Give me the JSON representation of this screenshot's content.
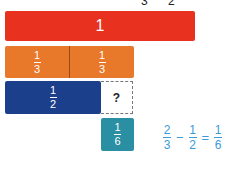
{
  "top_clipped": {
    "left": "3",
    "right": "2"
  },
  "bars": {
    "whole": {
      "label": "1",
      "color": "#e8311f"
    },
    "thirds": {
      "color": "#e8782a",
      "segments": [
        {
          "num": "1",
          "den": "3"
        },
        {
          "num": "1",
          "den": "3"
        }
      ]
    },
    "half": {
      "num": "1",
      "den": "2",
      "color": "#1c3f8c"
    },
    "unknown": {
      "label": "?"
    },
    "sixth": {
      "num": "1",
      "den": "6",
      "color": "#2a8fa3"
    }
  },
  "equation": {
    "a": {
      "num": "2",
      "den": "3"
    },
    "op1": "−",
    "b": {
      "num": "1",
      "den": "2"
    },
    "op2": "=",
    "c": {
      "num": "1",
      "den": "6"
    },
    "color": "#3a9bd6"
  }
}
